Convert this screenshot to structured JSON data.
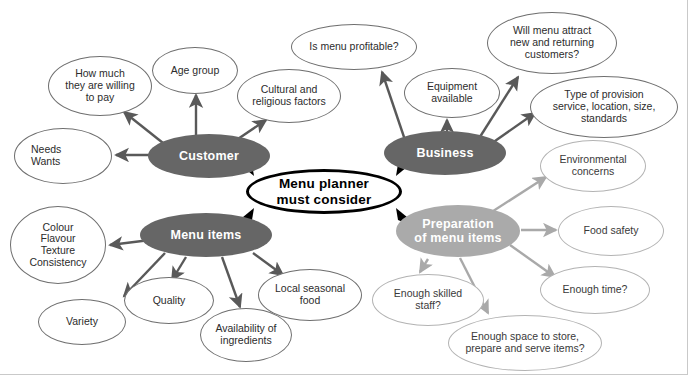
{
  "page": {
    "clipped_caption": "factors.",
    "canvas": {
      "width": 688,
      "height": 375
    },
    "colors": {
      "background": "#ffffff",
      "hub_dark": "#666666",
      "hub_pale": "#aaaaaa",
      "leaf_border_dark": "#6f6f6f",
      "leaf_border_light": "#b3b3b3",
      "centre_border": "#000000",
      "text_dark": "#2c2c2c",
      "text_on_hub": "#ffffff"
    }
  },
  "diagram": {
    "title": "Menu planner must consider",
    "centre": {
      "id": "centre",
      "label": "Menu planner\nmust consider",
      "line1": "Menu planner",
      "line2": "must consider",
      "x": 246,
      "y": 169,
      "w": 156,
      "h": 45
    },
    "branches": [
      {
        "id": "customer",
        "label": "Customer",
        "tone": "dark",
        "x": 148,
        "y": 134,
        "w": 122,
        "h": 44,
        "leaves": [
          {
            "id": "needs-wants",
            "label": "Needs\nWants",
            "line1": "Needs",
            "line2": "Wants",
            "tone": "dark",
            "align": "left",
            "x": 14,
            "y": 128,
            "w": 98,
            "h": 56
          },
          {
            "id": "willing-to-pay",
            "label": "How much\nthey are willing\nto pay",
            "line1": "How much",
            "line2": "they are willing",
            "line3": "to pay",
            "tone": "dark",
            "align": "center",
            "x": 48,
            "y": 56,
            "w": 104,
            "h": 60
          },
          {
            "id": "age-group",
            "label": "Age group",
            "tone": "dark",
            "align": "center",
            "x": 152,
            "y": 47,
            "w": 86,
            "h": 47
          },
          {
            "id": "cultural-religious",
            "label": "Cultural and\nreligious factors",
            "line1": "Cultural and",
            "line2": "religious factors",
            "tone": "dark",
            "align": "center",
            "x": 237,
            "y": 69,
            "w": 104,
            "h": 54
          }
        ]
      },
      {
        "id": "business",
        "label": "Business",
        "tone": "dark",
        "x": 384,
        "y": 131,
        "w": 122,
        "h": 44,
        "leaves": [
          {
            "id": "menu-profitable",
            "label": "Is menu profitable?",
            "tone": "dark",
            "align": "center",
            "x": 291,
            "y": 24,
            "w": 126,
            "h": 46
          },
          {
            "id": "equipment-available",
            "label": "Equipment\navailable",
            "line1": "Equipment",
            "line2": "available",
            "tone": "dark",
            "align": "center",
            "x": 404,
            "y": 68,
            "w": 96,
            "h": 50
          },
          {
            "id": "attract-customers",
            "label": "Will menu attract\nnew and returning\ncustomers?",
            "line1": "Will menu attract",
            "line2": "new and returning",
            "line3": "customers?",
            "tone": "dark",
            "align": "center",
            "x": 487,
            "y": 12,
            "w": 130,
            "h": 62
          },
          {
            "id": "type-of-provision",
            "label": "Type of provision\nservice, location, size,\nstandards",
            "line1": "Type of provision",
            "line2": "service, location, size,",
            "line3": "standards",
            "tone": "dark",
            "align": "center",
            "x": 530,
            "y": 76,
            "w": 148,
            "h": 62
          }
        ]
      },
      {
        "id": "menu-items",
        "label": "Menu items",
        "tone": "dark",
        "x": 140,
        "y": 213,
        "w": 132,
        "h": 44,
        "leaves": [
          {
            "id": "colour-flavour-texture",
            "label": "Colour\nFlavour\nTexture\nConsistency",
            "line1": "Colour",
            "line2": "Flavour",
            "line3": "Texture",
            "line4": "Consistency",
            "tone": "dark",
            "align": "center",
            "x": 10,
            "y": 206,
            "w": 96,
            "h": 78
          },
          {
            "id": "variety",
            "label": "Variety",
            "tone": "dark",
            "align": "center",
            "x": 38,
            "y": 299,
            "w": 88,
            "h": 46
          },
          {
            "id": "quality",
            "label": "Quality",
            "tone": "dark",
            "align": "center",
            "x": 124,
            "y": 277,
            "w": 90,
            "h": 47
          },
          {
            "id": "availability-ingredients",
            "label": "Availability of\ningredients",
            "line1": "Availability of",
            "line2": "ingredients",
            "tone": "dark",
            "align": "center",
            "x": 200,
            "y": 308,
            "w": 92,
            "h": 54
          },
          {
            "id": "local-seasonal-food",
            "label": "Local seasonal\nfood",
            "line1": "Local seasonal",
            "line2": "food",
            "tone": "dark",
            "align": "center",
            "x": 258,
            "y": 269,
            "w": 104,
            "h": 52
          }
        ]
      },
      {
        "id": "preparation",
        "label": "Preparation\nof menu items",
        "line1": "Preparation",
        "line2": "of menu items",
        "tone": "pale",
        "x": 396,
        "y": 205,
        "w": 124,
        "h": 52,
        "leaves": [
          {
            "id": "environmental-concerns",
            "label": "Environmental\nconcerns",
            "line1": "Environmental",
            "line2": "concerns",
            "tone": "light",
            "align": "center",
            "x": 540,
            "y": 140,
            "w": 106,
            "h": 52
          },
          {
            "id": "food-safety",
            "label": "Food safety",
            "tone": "light",
            "align": "center",
            "x": 558,
            "y": 206,
            "w": 106,
            "h": 50
          },
          {
            "id": "enough-time",
            "label": "Enough time?",
            "tone": "light",
            "align": "center",
            "x": 540,
            "y": 266,
            "w": 110,
            "h": 48
          },
          {
            "id": "enough-skilled-staff",
            "label": "Enough skilled\nstaff?",
            "line1": "Enough skilled",
            "line2": "staff?",
            "tone": "light",
            "align": "center",
            "x": 372,
            "y": 274,
            "w": 112,
            "h": 52
          },
          {
            "id": "enough-space",
            "label": "Enough space to store,\nprepare and serve items?",
            "line1": "Enough space to store,",
            "line2": "prepare and serve items?",
            "tone": "light",
            "align": "center",
            "x": 448,
            "y": 315,
            "w": 154,
            "h": 56
          }
        ]
      }
    ]
  }
}
